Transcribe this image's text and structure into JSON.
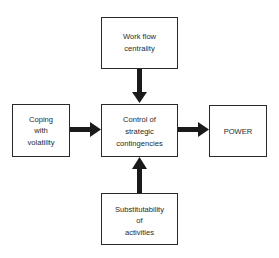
{
  "diagram": {
    "nodes": {
      "workflow": {
        "lines": [
          "Work flow",
          "centrality"
        ]
      },
      "coping": {
        "lines": [
          "Coping",
          "with",
          "volatility"
        ]
      },
      "control": {
        "lines": [
          "Control of",
          "strategic",
          "contingencies"
        ]
      },
      "power": {
        "lines": [
          "POWER"
        ]
      },
      "substitutability": {
        "lines": [
          "Substitutability",
          "of",
          "activities"
        ]
      }
    },
    "edges": [
      {
        "from": "workflow",
        "to": "control"
      },
      {
        "from": "coping",
        "to": "control"
      },
      {
        "from": "substitutability",
        "to": "control"
      },
      {
        "from": "control",
        "to": "power"
      }
    ],
    "colors": {
      "stroke": "#2a2a2a",
      "arrow": "#1a1a1a",
      "background": "#ffffff"
    }
  }
}
